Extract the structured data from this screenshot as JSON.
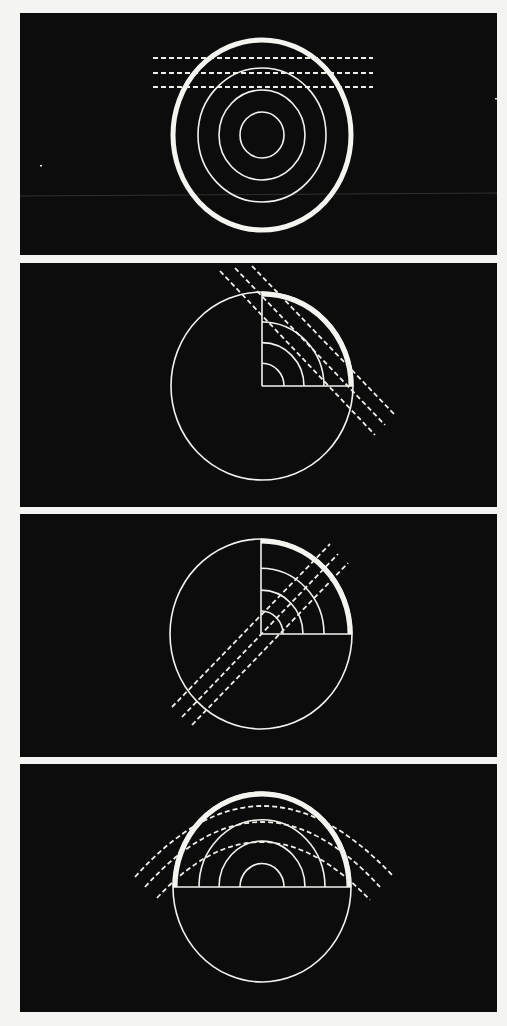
{
  "figure": {
    "background": "#f4f4f2",
    "panel_color": "#0c0c0c",
    "line_color": "#f2f2ee",
    "panels": [
      {
        "id": "panel-1",
        "description": "full concentric circles with horizontal dashed lines crossing the top",
        "rect": [
          20,
          13,
          477,
          242
        ],
        "center": [
          262,
          135
        ],
        "thick_ring": {
          "rx": 89,
          "ry": 95
        },
        "rings": [
          {
            "rx": 64,
            "ry": 67
          },
          {
            "rx": 43,
            "ry": 45
          },
          {
            "rx": 22,
            "ry": 23
          }
        ],
        "dashed_lines": [
          [
            153,
            58,
            373,
            58
          ],
          [
            153,
            73,
            373,
            73
          ],
          [
            153,
            87,
            373,
            87
          ]
        ],
        "faint_line": [
          20,
          196,
          497,
          193
        ],
        "specks": [
          [
            495,
            98
          ],
          [
            40,
            165
          ]
        ]
      },
      {
        "id": "panel-2",
        "description": "circle with top-right quarter wedge; dashed lines slanting down-right",
        "rect": [
          20,
          263,
          477,
          244
        ],
        "center": [
          262,
          386
        ],
        "outer": {
          "rx": 91,
          "ry": 94
        },
        "wedge": "top-right",
        "inner_arcs": [
          62,
          42,
          22
        ],
        "dashed_lines": [
          [
            220,
            271,
            375,
            435
          ],
          [
            235,
            268,
            385,
            425
          ],
          [
            252,
            266,
            395,
            415
          ]
        ]
      },
      {
        "id": "panel-3",
        "description": "circle with top-right quarter wedge; dashed lines slanting up-right through center",
        "rect": [
          20,
          514,
          477,
          243
        ],
        "center": [
          261,
          634
        ],
        "outer": {
          "rx": 91,
          "ry": 95
        },
        "wedge": "top-right",
        "inner_arcs": [
          63,
          42,
          22
        ],
        "dashed_lines": [
          [
            172,
            707,
            330,
            544
          ],
          [
            182,
            717,
            338,
            554
          ],
          [
            192,
            725,
            348,
            563
          ]
        ]
      },
      {
        "id": "panel-4",
        "description": "circle with upper half-disc of concentric semicircles; curved dashed arcs above",
        "rect": [
          20,
          764,
          477,
          248
        ],
        "center": [
          262,
          887
        ],
        "outer": {
          "rx": 89,
          "ry": 95
        },
        "wedge": "top-half",
        "inner_arcs": [
          63,
          43,
          22
        ],
        "dashed_arcs": [
          {
            "start": [
              135,
              877
            ],
            "top": [
              262,
              806
            ],
            "end": [
              392,
              875
            ]
          },
          {
            "start": [
              145,
              887
            ],
            "top": [
              262,
              822
            ],
            "end": [
              380,
              887
            ]
          },
          {
            "start": [
              157,
              898
            ],
            "top": [
              262,
              842
            ],
            "end": [
              370,
              900
            ]
          }
        ]
      }
    ]
  }
}
